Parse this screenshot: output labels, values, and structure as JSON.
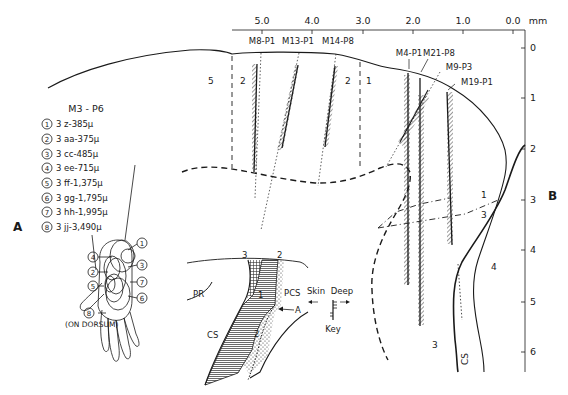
{
  "figure": {
    "panel_labels": {
      "a": "A",
      "b": "B"
    },
    "top_axis": {
      "unit": "mm",
      "ticks": [
        "5.0",
        "4.0",
        "3.0",
        "2.0",
        "1.0",
        "0.0"
      ]
    },
    "right_axis": {
      "ticks": [
        "0",
        "1",
        "2",
        "3",
        "4",
        "5",
        "6"
      ]
    },
    "electrode_tracks": [
      {
        "id": "M8-P1"
      },
      {
        "id": "M13-P1"
      },
      {
        "id": "M14-P8"
      },
      {
        "id": "M4-P1"
      },
      {
        "id": "M21-P8"
      },
      {
        "id": "M9-P3"
      },
      {
        "id": "M19-P1"
      }
    ],
    "zone_labels": {
      "z5": "5",
      "z2a": "2",
      "z2b": "2",
      "z1a": "1",
      "z1b": "1",
      "z3a": "3",
      "z3b": "3",
      "z4": "4",
      "cs_right": "CS"
    },
    "legend": {
      "title": "M3 - P6",
      "items": [
        {
          "num": "1",
          "text": "3 z-385μ"
        },
        {
          "num": "2",
          "text": "3 aa-375μ"
        },
        {
          "num": "3",
          "text": "3 cc-485μ"
        },
        {
          "num": "4",
          "text": "3 ee-715μ"
        },
        {
          "num": "5",
          "text": "3 ff-1,375μ"
        },
        {
          "num": "6",
          "text": "3 gg-1,795μ"
        },
        {
          "num": "7",
          "text": "3 hh-1,995μ"
        },
        {
          "num": "8",
          "text": "3 jj-3,490μ"
        }
      ]
    },
    "hand": {
      "callouts": [
        "1",
        "2",
        "3",
        "4",
        "5",
        "6",
        "7",
        "8"
      ],
      "dorsum_note": "(ON DORSUM)"
    },
    "inset": {
      "labels": {
        "pr": "PR",
        "pcs": "PCS",
        "cs": "CS",
        "a": "A",
        "area3": "3",
        "area2_top": "2",
        "area1": "1",
        "area2": "2"
      }
    },
    "key": {
      "skin": "Skin",
      "deep": "Deep",
      "label": "Key"
    }
  }
}
